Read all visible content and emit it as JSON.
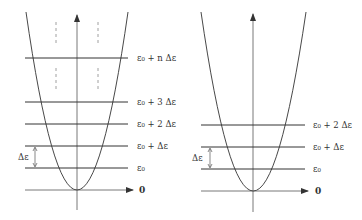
{
  "diagrams": [
    {
      "name": "equally-spaced-levels",
      "levels": [
        {
          "label": "ε₀",
          "y": 168
        },
        {
          "label": "ε₀ + Δε",
          "y": 146
        },
        {
          "label": "ε₀ + 2 Δε",
          "y": 124
        },
        {
          "label": "ε₀ + 3 Δε",
          "y": 102
        },
        {
          "label": "ε₀ + n Δε",
          "y": 58
        }
      ],
      "zero_label": "0",
      "spacing_label": "Δε"
    },
    {
      "name": "wide-parabola-levels",
      "levels": [
        {
          "label": "ε₀",
          "y": 169
        },
        {
          "label": "ε₀ + Δε",
          "y": 147
        },
        {
          "label": "ε₀ + 2 Δε",
          "y": 125
        }
      ],
      "zero_label": "0",
      "spacing_label": "Δε"
    }
  ],
  "colors": {
    "line": "#333333",
    "dash": "#888888"
  }
}
